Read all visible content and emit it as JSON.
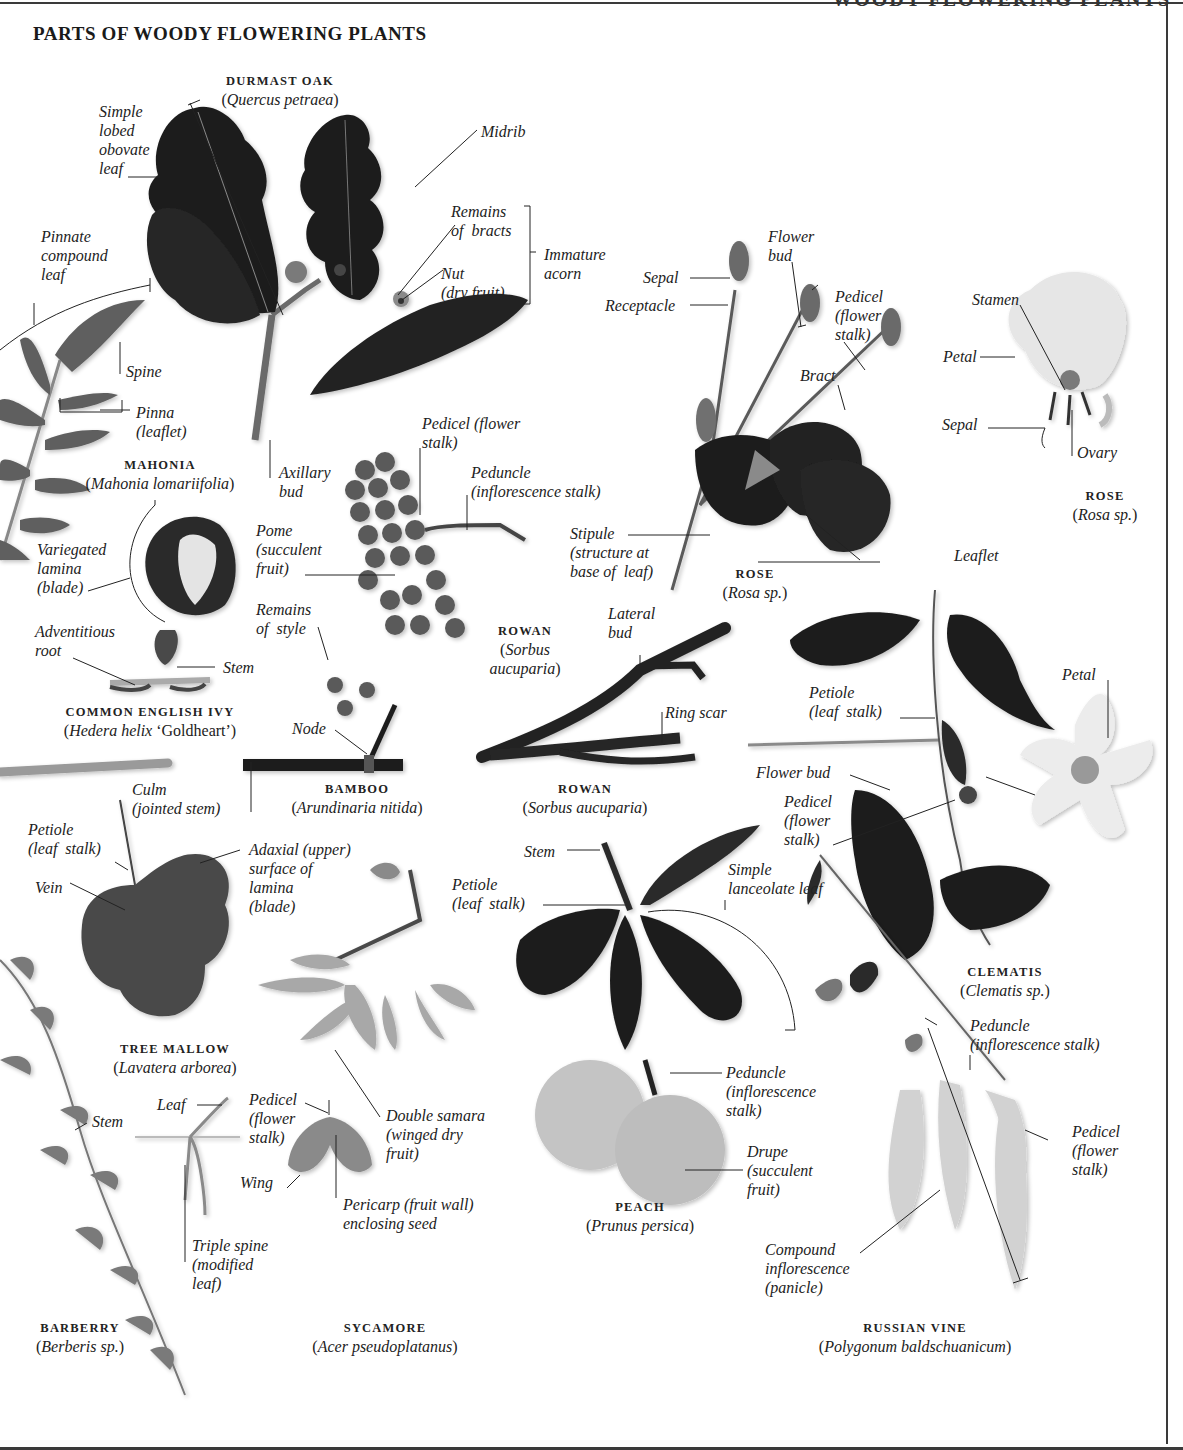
{
  "page": {
    "running_head": "WOODY FLOWERING PLANTS",
    "title": "PARTS OF WOODY FLOWERING PLANTS"
  },
  "colors": {
    "background": "#ffffff",
    "rule": "#3a3a3a",
    "text": "#222222",
    "dark_leaf": "#1e1e1e",
    "mid_leaf": "#555555",
    "light_leaf": "#8a8a8a",
    "pale": "#c8c8c8"
  },
  "specimens": [
    {
      "id": "durmast-oak",
      "common": "DURMAST OAK",
      "latin": "Quercus petraea",
      "latin_suffix": ""
    },
    {
      "id": "mahonia",
      "common": "MAHONIA",
      "latin": "Mahonia lomariifolia",
      "latin_suffix": ""
    },
    {
      "id": "rose-1",
      "common": "ROSE",
      "latin": "Rosa sp.",
      "latin_suffix": ""
    },
    {
      "id": "rose-2",
      "common": "ROSE",
      "latin": "Rosa sp.",
      "latin_suffix": ""
    },
    {
      "id": "common-english-ivy",
      "common": "COMMON ENGLISH IVY",
      "latin": "Hedera helix",
      "latin_suffix": " ‘Goldheart’"
    },
    {
      "id": "rowan-1",
      "common": "ROWAN",
      "latin": "Sorbus aucuparia",
      "latin_suffix": ""
    },
    {
      "id": "rowan-2",
      "common": "ROWAN",
      "latin": "Sorbus aucuparia",
      "latin_suffix": ""
    },
    {
      "id": "bamboo",
      "common": "BAMBOO",
      "latin": "Arundinaria nitida",
      "latin_suffix": ""
    },
    {
      "id": "tree-mallow",
      "common": "TREE MALLOW",
      "latin": "Lavatera arborea",
      "latin_suffix": ""
    },
    {
      "id": "clematis",
      "common": "CLEMATIS",
      "latin": "Clematis sp.",
      "latin_suffix": ""
    },
    {
      "id": "peach",
      "common": "PEACH",
      "latin": "Prunus persica",
      "latin_suffix": ""
    },
    {
      "id": "barberry",
      "common": "BARBERRY",
      "latin": "Berberis sp.",
      "latin_suffix": ""
    },
    {
      "id": "sycamore",
      "common": "SYCAMORE",
      "latin": "Acer pseudoplatanus",
      "latin_suffix": ""
    },
    {
      "id": "russian-vine",
      "common": "RUSSIAN VINE",
      "latin": "Polygonum baldschuanicum",
      "latin_suffix": ""
    }
  ],
  "labels": {
    "oak_simple_lobed": "Simple\nlobed\nobovate\nleaf",
    "oak_midrib": "Midrib",
    "oak_remains_bracts": "Remains\nof  bracts",
    "oak_nut": "Nut\n(dry fruit)",
    "oak_immature_acorn": "Immature\nacorn",
    "oak_axillary_bud": "Axillary\nbud",
    "mahonia_pinnate": "Pinnate\ncompound\nleaf",
    "mahonia_spine": "Spine",
    "mahonia_pinna": "Pinna\n(leaflet)",
    "rose_sepal": "Sepal",
    "rose_receptacle": "Receptacle",
    "rose_flower_bud": "Flower\nbud",
    "rose_pedicel": "Pedicel\n(flower\nstalk)",
    "rose_bract": "Bract",
    "rose_stipule": "Stipule\n(structure at\nbase of  leaf)",
    "rose_leaflet": "Leaflet",
    "rose2_stamen": "Stamen",
    "rose2_petal": "Petal",
    "rose2_sepal": "Sepal",
    "rose2_ovary": "Ovary",
    "rowan_pedicel": "Pedicel (flower\nstalk)",
    "rowan_peduncle": "Peduncle\n(inflorescence stalk)",
    "rowan_pome": "Pome\n(succulent\nfruit)",
    "rowan_remains_style": "Remains\nof  style",
    "rowan_lateral_bud": "Lateral\nbud",
    "rowan_ring_scar": "Ring scar",
    "ivy_variegated": "Variegated\nlamina\n(blade)",
    "ivy_adventitious": "Adventitious\nroot",
    "ivy_stem": "Stem",
    "bamboo_node": "Node",
    "bamboo_culm": "Culm\n(jointed stem)",
    "clematis_petiole": "Petiole\n(leaf  stalk)",
    "clematis_petal": "Petal",
    "clematis_flower_bud": "Flower bud",
    "clematis_pedicel": "Pedicel\n(flower\nstalk)",
    "mallow_petiole": "Petiole\n(leaf  stalk)",
    "mallow_vein": "Vein",
    "mallow_adaxial": "Adaxial (upper)\nsurface of\nlamina\n(blade)",
    "peach_stem": "Stem",
    "peach_petiole": "Petiole\n(leaf  stalk)",
    "peach_simple_lanceolate": "Simple\nlanceolate leaf",
    "peach_peduncle": "Peduncle\n(inflorescence\nstalk)",
    "peach_drupe": "Drupe\n(succulent\nfruit)",
    "barberry_stem": "Stem",
    "barberry_leaf": "Leaf",
    "barberry_triple_spine": "Triple spine\n(modified\nleaf)",
    "sycamore_pedicel": "Pedicel\n(flower\nstalk)",
    "sycamore_double_samara": "Double samara\n(winged dry\nfruit)",
    "sycamore_wing": "Wing",
    "sycamore_pericarp": "Pericarp (fruit wall)\nenclosing seed",
    "vine_peduncle": "Peduncle\n(inflorescence stalk)",
    "vine_pedicel": "Pedicel\n(flower\nstalk)",
    "vine_compound": "Compound\ninflorescence\n(panicle)"
  }
}
